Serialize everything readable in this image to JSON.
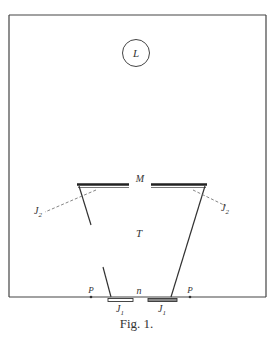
{
  "figure": {
    "caption": "Fig. 1.",
    "labels": {
      "lamp": "L",
      "mirror": "M",
      "trapezoid": "T",
      "bottom_opening": "n",
      "point_left": "P",
      "point_right": "P",
      "j1_left": "J",
      "j1_right": "J",
      "j1_subscript": "1",
      "j2_left": "J",
      "j2_right": "J",
      "j2_subscript": "2"
    }
  },
  "colors": {
    "ink": "#333333",
    "background": "#ffffff"
  }
}
